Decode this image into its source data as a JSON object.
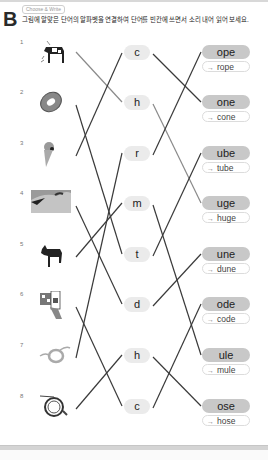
{
  "header": {
    "section_letter": "B",
    "tag": "Choose & Write",
    "instruction": "그림에 알맞은 단어의 알파벳을 연결하여 단어를 빈칸에 쓰면서 소리 내어 읽어 보세요."
  },
  "pictures": [
    {
      "number": "1",
      "icon": "cow-icon"
    },
    {
      "number": "2",
      "icon": "tube-ring-icon"
    },
    {
      "number": "3",
      "icon": "ice-cream-cone-icon"
    },
    {
      "number": "4",
      "icon": "sand-dune-icon"
    },
    {
      "number": "5",
      "icon": "mule-icon"
    },
    {
      "number": "6",
      "icon": "qr-code-icon"
    },
    {
      "number": "7",
      "icon": "rope-icon"
    },
    {
      "number": "8",
      "icon": "hose-icon"
    }
  ],
  "letters": [
    "c",
    "h",
    "r",
    "m",
    "t",
    "d",
    "h",
    "c"
  ],
  "endings": [
    {
      "ending": "ope",
      "answer": "rope"
    },
    {
      "ending": "one",
      "answer": "cone"
    },
    {
      "ending": "ube",
      "answer": "tube"
    },
    {
      "ending": "uge",
      "answer": "huge"
    },
    {
      "ending": "une",
      "answer": "dune"
    },
    {
      "ending": "ode",
      "answer": "code"
    },
    {
      "ending": "ule",
      "answer": "mule"
    },
    {
      "ending": "ose",
      "answer": "hose"
    }
  ],
  "answer_arrow": "→",
  "connections": {
    "picture_to_letter": [
      1,
      4,
      0,
      5,
      3,
      7,
      2,
      6
    ],
    "letter_to_ending": [
      1,
      3,
      0,
      6,
      2,
      4,
      7,
      5
    ],
    "highlighted_picture_lines": [
      0
    ],
    "highlighted_letter_lines": [
      1
    ]
  },
  "colors": {
    "line": "#3a3a3a",
    "line_highlight": "#8a8a8a",
    "letter_bg": "#ebebeb",
    "ending_bg": "#c8c8c8"
  }
}
